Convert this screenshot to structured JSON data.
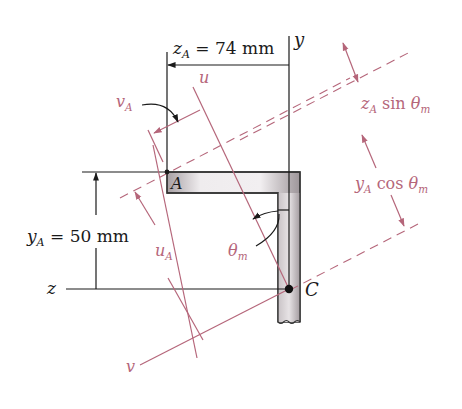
{
  "diagram": {
    "type": "angle-section principal axes",
    "colors": {
      "ink": "#1a1a1a",
      "accent": "#b5667a",
      "section_fill_light": "#e6e2e4",
      "section_fill_dark": "#9d9599"
    },
    "labels": {
      "zA_dim": {
        "var": "z",
        "sub": "A",
        "value": " = 74 mm"
      },
      "yA_dim": {
        "var": "y",
        "sub": "A",
        "value": " = 50 mm"
      },
      "y_axis": "y",
      "z_axis": "z",
      "u_axis": "u",
      "v_axis": "v",
      "point_A": "A",
      "point_C": "C",
      "vA": {
        "var": "v",
        "sub": "A"
      },
      "uA": {
        "var": "u",
        "sub": "A"
      },
      "theta_m": {
        "var": "θ",
        "sub": "m"
      },
      "zA_sin": {
        "var": "z",
        "sub": "A",
        "rest": " sin ",
        "theta": "θ",
        "theta_sub": "m"
      },
      "yA_cos": {
        "var": "y",
        "sub": "A",
        "rest": " cos ",
        "theta": "θ",
        "theta_sub": "m"
      }
    }
  }
}
